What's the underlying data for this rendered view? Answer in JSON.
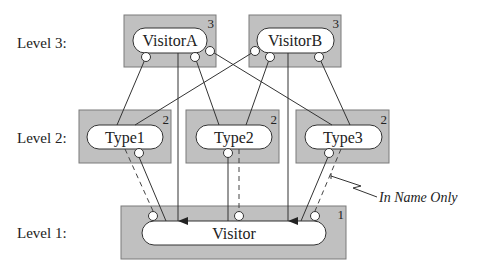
{
  "levels": [
    {
      "label": "Level 3:"
    },
    {
      "label": "Level 2:"
    },
    {
      "label": "Level 1:"
    }
  ],
  "nodes": {
    "visitorA": {
      "label": "VisitorA",
      "level_number": "3"
    },
    "visitorB": {
      "label": "VisitorB",
      "level_number": "3"
    },
    "type1": {
      "label": "Type1",
      "level_number": "2"
    },
    "type2": {
      "label": "Type2",
      "level_number": "2"
    },
    "type3": {
      "label": "Type3",
      "level_number": "2"
    },
    "visitor": {
      "label": "Visitor",
      "level_number": "1"
    }
  },
  "annotation": {
    "label": "In Name Only"
  },
  "colors": {
    "box_fill": "#c0c0c0",
    "pill_fill": "#ffffff",
    "line": "#333333"
  }
}
